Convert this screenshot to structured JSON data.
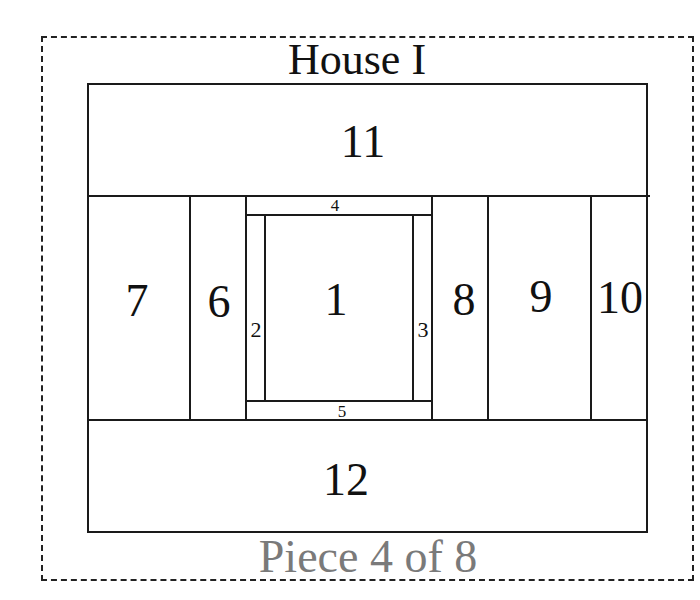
{
  "title": "House I",
  "footer": "Piece 4 of 8",
  "colors": {
    "line": "#1a1a1a",
    "text": "#111111",
    "footer_text": "#7a7a7a",
    "background": "#ffffff"
  },
  "pieces": [
    {
      "id": "1",
      "label": "1"
    },
    {
      "id": "2",
      "label": "2"
    },
    {
      "id": "3",
      "label": "3"
    },
    {
      "id": "4",
      "label": "4"
    },
    {
      "id": "5",
      "label": "5"
    },
    {
      "id": "6",
      "label": "6"
    },
    {
      "id": "7",
      "label": "7"
    },
    {
      "id": "8",
      "label": "8"
    },
    {
      "id": "9",
      "label": "9"
    },
    {
      "id": "10",
      "label": "10"
    },
    {
      "id": "11",
      "label": "11"
    },
    {
      "id": "12",
      "label": "12"
    }
  ]
}
